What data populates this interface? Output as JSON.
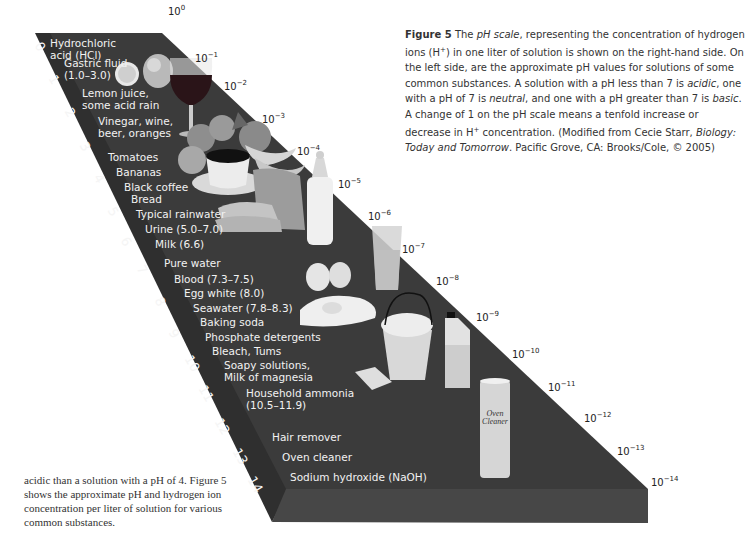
{
  "figure": {
    "caption": {
      "label": "Figure 5",
      "text_parts": [
        {
          "t": " The ",
          "style": "normal"
        },
        {
          "t": "pH scale",
          "style": "italic"
        },
        {
          "t": ", representing the concentration of hydrogen ions (H",
          "style": "normal"
        },
        {
          "t": "+",
          "style": "sup"
        },
        {
          "t": ") in one liter of solution is shown on the right-hand side. On the left side, are the approximate pH values for solutions of some common substances. A solution with a pH less than 7 is ",
          "style": "normal"
        },
        {
          "t": "acidic",
          "style": "italic"
        },
        {
          "t": ", one with a pH of 7 is ",
          "style": "normal"
        },
        {
          "t": "neutral",
          "style": "italic"
        },
        {
          "t": ", and one with a pH greater than 7 is ",
          "style": "normal"
        },
        {
          "t": "basic",
          "style": "italic"
        },
        {
          "t": ". A change of 1 on the pH scale means a tenfold increase or decrease in H",
          "style": "normal"
        },
        {
          "t": "+",
          "style": "sup"
        },
        {
          "t": " concentration. (Modified from Cecie Starr, ",
          "style": "normal"
        },
        {
          "t": "Biology: Today and Tomorrow",
          "style": "italic"
        },
        {
          "t": ". Pacific Grove, CA: Brooks/Cole, © 2005)",
          "style": "normal"
        }
      ]
    },
    "body_text": "acidic than a solution with a pH of 4. Figure 5 shows the approximate pH and hydrogen ion concentration per liter of solution for various common substances.",
    "colors": {
      "slab_top": "#3b3b3b",
      "slab_front": "#474747",
      "slab_side": "#2e2e2e",
      "label_text": "#f2f2f2",
      "background": "#ffffff"
    },
    "ph_numbers": [
      "0",
      "1",
      "2",
      "3",
      "4",
      "5",
      "6",
      "7",
      "8",
      "9",
      "10",
      "11",
      "12",
      "13",
      "14"
    ],
    "concentration_labels": [
      {
        "base": "10",
        "exp": "0"
      },
      {
        "base": "10",
        "exp": "−1"
      },
      {
        "base": "10",
        "exp": "−2"
      },
      {
        "base": "10",
        "exp": "−3"
      },
      {
        "base": "10",
        "exp": "−4"
      },
      {
        "base": "10",
        "exp": "−5"
      },
      {
        "base": "10",
        "exp": "−6"
      },
      {
        "base": "10",
        "exp": "−7"
      },
      {
        "base": "10",
        "exp": "−8"
      },
      {
        "base": "10",
        "exp": "−9"
      },
      {
        "base": "10",
        "exp": "−10"
      },
      {
        "base": "10",
        "exp": "−11"
      },
      {
        "base": "10",
        "exp": "−12"
      },
      {
        "base": "10",
        "exp": "−13"
      },
      {
        "base": "10",
        "exp": "−14"
      }
    ],
    "substances": [
      {
        "line1": "Hydrochloric",
        "line2": "acid (HCl)"
      },
      {
        "line1": "Gastric fluid",
        "line2": "(1.0–3.0)"
      },
      {
        "line1": "Lemon juice,",
        "line2": "some acid rain"
      },
      {
        "line1": "Vinegar, wine,",
        "line2": "beer, oranges"
      },
      {
        "line1": "Tomatoes"
      },
      {
        "line1": "Bananas"
      },
      {
        "line1": "Black coffee"
      },
      {
        "line1": "Bread"
      },
      {
        "line1": "Typical rainwater"
      },
      {
        "line1": "Urine (5.0–7.0)"
      },
      {
        "line1": "Milk (6.6)"
      },
      {
        "line1": "Pure water"
      },
      {
        "line1": "Blood (7.3–7.5)"
      },
      {
        "line1": "Egg white (8.0)"
      },
      {
        "line1": "Seawater (7.8–8.3)"
      },
      {
        "line1": "Baking soda"
      },
      {
        "line1": "Phosphate detergents"
      },
      {
        "line1": "Bleach, Tums"
      },
      {
        "line1": "Soapy solutions,",
        "line2": "Milk of magnesia"
      },
      {
        "line1": "Household ammonia",
        "line2": "(10.5–11.9)"
      },
      {
        "line1": "Hair remover"
      },
      {
        "line1": "Oven cleaner"
      },
      {
        "line1": "Sodium hydroxide (NaOH)"
      }
    ],
    "product_text": {
      "oven_can_line1": "Oven",
      "oven_can_line2": "Cleaner"
    },
    "illustrated_objects": [
      "lemon-half",
      "lemon",
      "wine-glass",
      "tomatoes",
      "bananas",
      "coffee-cup",
      "bread",
      "baby-bottle",
      "water-glass",
      "egg",
      "bucket",
      "bleach-bottle",
      "soap-bar",
      "oven-cleaner-can"
    ]
  }
}
